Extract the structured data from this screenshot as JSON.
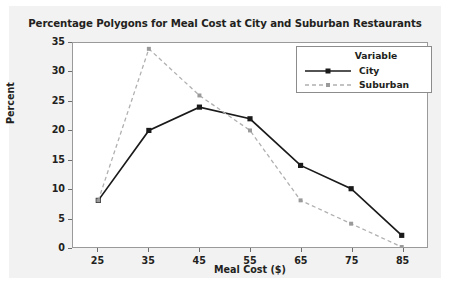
{
  "chart_data": {
    "type": "line",
    "title": "Percentage Polygons for Meal Cost at City and Suburban Restaurants",
    "xlabel": "Meal Cost ($)",
    "ylabel": "Percent",
    "x": [
      25,
      35,
      45,
      55,
      65,
      75,
      85
    ],
    "xticklabels": [
      "25",
      "35",
      "45",
      "55",
      "65",
      "75",
      "85"
    ],
    "yticks": [
      0,
      5,
      10,
      15,
      20,
      25,
      30,
      35
    ],
    "yticklabels": [
      "0",
      "5",
      "10",
      "15",
      "20",
      "25",
      "30",
      "35"
    ],
    "xlim": [
      20,
      90
    ],
    "ylim": [
      0,
      35
    ],
    "grid": false,
    "legend_position": "top-right",
    "legend_title": "Variable",
    "series": [
      {
        "name": "City",
        "values": [
          8,
          20,
          24,
          22,
          14,
          10,
          2
        ],
        "color": "#1a1a1a",
        "linestyle": "solid",
        "marker": "filled-diamond"
      },
      {
        "name": "Suburban",
        "values": [
          8,
          34,
          26,
          20,
          8,
          4,
          0
        ],
        "color": "#b0b0b0",
        "linestyle": "dashed",
        "marker": "small-circle"
      }
    ]
  },
  "figure": {
    "background_color": "#f2f2f2",
    "plot_background_color": "#ffffff",
    "border_color": "#9a9a9a"
  }
}
